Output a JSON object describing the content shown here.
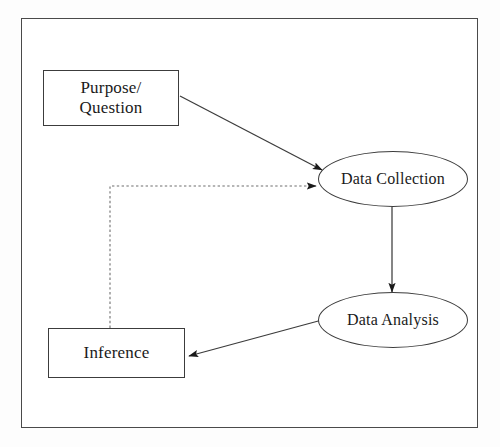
{
  "diagram": {
    "type": "flowchart",
    "frame": {
      "border_color": "#4a4a4a",
      "background_color": "#ffffff"
    },
    "nodes": [
      {
        "id": "purpose",
        "label": "Purpose/\nQuestion",
        "shape": "rectangle",
        "x": 43,
        "y": 70,
        "w": 136,
        "h": 56
      },
      {
        "id": "data-collection",
        "label": "Data Collection",
        "shape": "ellipse",
        "x": 318,
        "y": 151,
        "w": 150,
        "h": 56
      },
      {
        "id": "data-analysis",
        "label": "Data Analysis",
        "shape": "ellipse",
        "x": 318,
        "y": 292,
        "w": 150,
        "h": 56
      },
      {
        "id": "inference",
        "label": "Inference",
        "shape": "rectangle",
        "x": 48,
        "y": 328,
        "w": 137,
        "h": 50
      }
    ],
    "edges": [
      {
        "id": "purpose-to-collection",
        "from": "purpose",
        "to": "data-collection",
        "style": "solid",
        "arrow": "end"
      },
      {
        "id": "collection-to-analysis",
        "from": "data-collection",
        "to": "data-analysis",
        "style": "solid",
        "arrow": "end"
      },
      {
        "id": "analysis-to-inference",
        "from": "data-analysis",
        "to": "inference",
        "style": "solid",
        "arrow": "end"
      },
      {
        "id": "inference-to-collection",
        "from": "inference",
        "to": "data-collection",
        "style": "dashed",
        "arrow": "end"
      }
    ],
    "colors": {
      "stroke": "#3c3c3c",
      "dashed_stroke": "#6e6e6e",
      "text": "#1a1a1a",
      "arrowhead": "#1a1a1a"
    }
  }
}
